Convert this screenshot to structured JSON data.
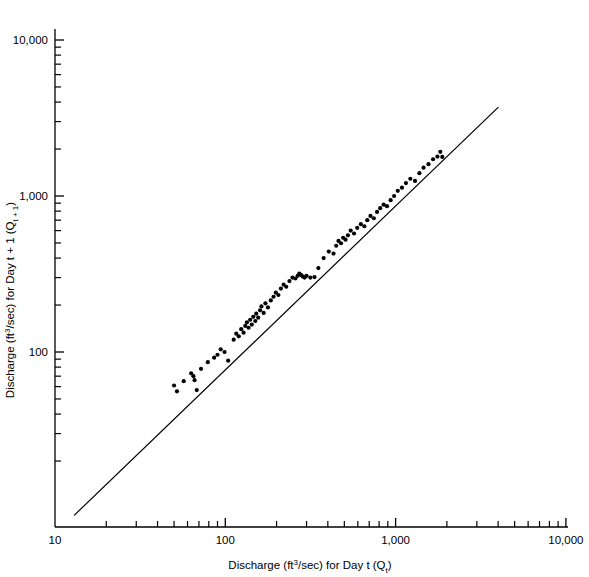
{
  "chart_data": {
    "type": "scatter",
    "title": "",
    "subtitle": "",
    "xlabel": "Discharge (ft3/sec) for Day t (Qt)",
    "ylabel": "Discharge (ft3/sec) for Day t + 1 (Qt+1)",
    "xlabel_parts": {
      "pre": "Discharge (ft",
      "sup": "3",
      "mid": "/sec) for Day t (Q",
      "sub": "t",
      "post": ")"
    },
    "ylabel_parts": {
      "pre": "Discharge (ft",
      "sup": "3",
      "mid": "/sec) for Day t + 1 (Q",
      "sub": "t + 1",
      "post": ")"
    },
    "xscale": "log",
    "yscale": "log",
    "xlim": [
      10,
      10000
    ],
    "ylim": [
      7.6,
      10000
    ],
    "grid": false,
    "legend": "none",
    "xticks": [
      10,
      100,
      1000,
      10000
    ],
    "xtick_labels": [
      "10",
      "100",
      "1,000",
      "10,000"
    ],
    "yticks": [
      100,
      1000,
      10000
    ],
    "ytick_labels": [
      "100",
      "1,000",
      "10,000"
    ],
    "minor_ticks": [
      2,
      3,
      4,
      5,
      6,
      7,
      8,
      9
    ],
    "series": [
      {
        "name": "Daily discharge pairs",
        "marker": "filled-circle",
        "marker_color": "#000000",
        "marker_size_px": 4.2,
        "points": [
          [
            50,
            61
          ],
          [
            52,
            56
          ],
          [
            57,
            65
          ],
          [
            63,
            73
          ],
          [
            65,
            70
          ],
          [
            66,
            66
          ],
          [
            68,
            57
          ],
          [
            72,
            78
          ],
          [
            79,
            86
          ],
          [
            86,
            92
          ],
          [
            90,
            96
          ],
          [
            94,
            104
          ],
          [
            99,
            100
          ],
          [
            104,
            88
          ],
          [
            112,
            120
          ],
          [
            116,
            131
          ],
          [
            120,
            126
          ],
          [
            124,
            140
          ],
          [
            128,
            133
          ],
          [
            131,
            147
          ],
          [
            134,
            155
          ],
          [
            137,
            143
          ],
          [
            140,
            161
          ],
          [
            143,
            150
          ],
          [
            146,
            168
          ],
          [
            150,
            158
          ],
          [
            152,
            176
          ],
          [
            156,
            166
          ],
          [
            160,
            185
          ],
          [
            163,
            196
          ],
          [
            168,
            178
          ],
          [
            172,
            205
          ],
          [
            178,
            193
          ],
          [
            185,
            214
          ],
          [
            192,
            226
          ],
          [
            198,
            240
          ],
          [
            205,
            232
          ],
          [
            212,
            255
          ],
          [
            220,
            270
          ],
          [
            228,
            262
          ],
          [
            238,
            285
          ],
          [
            248,
            300
          ],
          [
            258,
            296
          ],
          [
            266,
            308
          ],
          [
            272,
            318
          ],
          [
            278,
            312
          ],
          [
            285,
            305
          ],
          [
            292,
            300
          ],
          [
            300,
            308
          ],
          [
            316,
            300
          ],
          [
            334,
            302
          ],
          [
            352,
            345
          ],
          [
            378,
            400
          ],
          [
            405,
            440
          ],
          [
            432,
            428
          ],
          [
            448,
            480
          ],
          [
            462,
            515
          ],
          [
            478,
            498
          ],
          [
            492,
            540
          ],
          [
            508,
            525
          ],
          [
            525,
            560
          ],
          [
            545,
            600
          ],
          [
            570,
            575
          ],
          [
            595,
            625
          ],
          [
            625,
            660
          ],
          [
            655,
            640
          ],
          [
            682,
            700
          ],
          [
            712,
            745
          ],
          [
            745,
            720
          ],
          [
            778,
            790
          ],
          [
            812,
            835
          ],
          [
            850,
            880
          ],
          [
            890,
            860
          ],
          [
            935,
            940
          ],
          [
            980,
            1000
          ],
          [
            1030,
            1080
          ],
          [
            1090,
            1130
          ],
          [
            1150,
            1210
          ],
          [
            1220,
            1290
          ],
          [
            1300,
            1250
          ],
          [
            1380,
            1400
          ],
          [
            1460,
            1520
          ],
          [
            1560,
            1600
          ],
          [
            1660,
            1720
          ],
          [
            1760,
            1790
          ],
          [
            1830,
            1920
          ],
          [
            1880,
            1780
          ]
        ]
      }
    ],
    "reference_line": {
      "name": "1:1 regression line",
      "color": "#000000",
      "width_px": 1.2,
      "x_start": 13.0,
      "y_start": 9.0,
      "x_end": 4000,
      "y_end": 3700
    }
  }
}
